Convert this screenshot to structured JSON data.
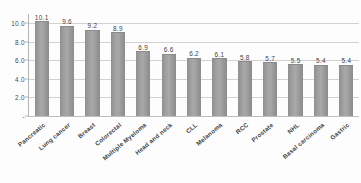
{
  "chart_data": {
    "type": "bar",
    "title": "",
    "xlabel": "",
    "ylabel": "",
    "ylim": [
      0,
      11
    ],
    "grid": true,
    "legend": "none",
    "orientation": "vertical",
    "categories": [
      "Pancreatic",
      "Lung cancer",
      "Breast",
      "Colorectal",
      "Multiple Myeloma",
      "Head and neck",
      "CLL",
      "Melanoma",
      "RCC",
      "Prostate",
      "NHL",
      "Basal carcinoma",
      "Gastric"
    ],
    "values": [
      10.1,
      9.6,
      9.2,
      8.9,
      6.9,
      6.6,
      6.2,
      6.1,
      5.8,
      5.7,
      5.5,
      5.4,
      5.4
    ],
    "data_labels": [
      "10.1",
      "9.6",
      "9.2",
      "8.9",
      "6.9",
      "6.6",
      "6.2",
      "6.1",
      "5.8",
      "5.7",
      "5.5",
      "5.4",
      "5.4"
    ],
    "y_ticks": [
      {
        "value": 10,
        "label": "10.0"
      },
      {
        "value": 8,
        "label": "8.0"
      },
      {
        "value": 6,
        "label": "6.0"
      },
      {
        "value": 4,
        "label": "4.0"
      },
      {
        "value": 2,
        "label": "2.0"
      },
      {
        "value": 0,
        "label": "-"
      }
    ],
    "colors": {
      "bar": "#9d9d9d",
      "bar_edge": "#8a8a8a",
      "gridline": "#d2d2d2",
      "axis": "#b4b4b4",
      "text": "#3d3d3d",
      "background": "#fdfdfd"
    }
  }
}
